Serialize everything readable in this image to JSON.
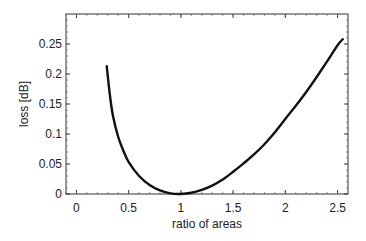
{
  "chart_data": {
    "type": "line",
    "title": "",
    "xlabel": "ratio of areas",
    "ylabel": "loss [dB]",
    "xlim": [
      -0.1,
      2.6
    ],
    "ylim": [
      0,
      0.3
    ],
    "xticks": [
      0,
      0.5,
      1,
      1.5,
      2,
      2.5
    ],
    "xtick_labels": [
      "0",
      "0.5",
      "1",
      "1.5",
      "2",
      "2.5"
    ],
    "yticks": [
      0,
      0.05,
      0.1,
      0.15,
      0.2,
      0.25
    ],
    "ytick_labels": [
      "0",
      "0.05",
      "0.1",
      "0.15",
      "0.2",
      "0.25"
    ],
    "grid": false,
    "legend": null,
    "series": [
      {
        "name": "loss",
        "color": "#111111",
        "x": [
          0.29,
          0.32,
          0.35,
          0.4,
          0.45,
          0.5,
          0.6,
          0.7,
          0.8,
          0.9,
          1.0,
          1.1,
          1.2,
          1.3,
          1.4,
          1.5,
          1.6,
          1.7,
          1.8,
          1.9,
          2.0,
          2.1,
          2.2,
          2.3,
          2.4,
          2.5,
          2.55
        ],
        "y": [
          0.213,
          0.165,
          0.13,
          0.095,
          0.072,
          0.053,
          0.03,
          0.015,
          0.006,
          0.001,
          0.0,
          0.002,
          0.007,
          0.014,
          0.024,
          0.037,
          0.051,
          0.066,
          0.083,
          0.103,
          0.125,
          0.147,
          0.17,
          0.195,
          0.221,
          0.248,
          0.258
        ]
      }
    ]
  }
}
